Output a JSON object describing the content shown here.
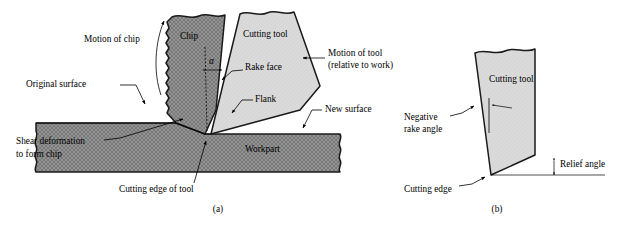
{
  "figure": {
    "subcaptions": [
      {
        "id": "a",
        "label": "(a)"
      },
      {
        "id": "b",
        "label": "(b)"
      }
    ]
  },
  "panel_a": {
    "region_labels": {
      "chip": "Chip",
      "cutting_tool": "Cutting tool",
      "workpart": "Workpart"
    },
    "callouts": {
      "motion_of_chip": "Motion of chip",
      "original_surface": "Original surface",
      "shear_deformation_line1": "Shear deformation",
      "shear_deformation_line2": "to form chip",
      "cutting_edge_of_tool": "Cutting edge of tool",
      "rake_face": "Rake face",
      "flank": "Flank",
      "motion_of_tool_line1": "Motion of tool",
      "motion_of_tool_line2": "(relative to work)",
      "new_surface": "New surface",
      "rake_angle_symbol": "α"
    }
  },
  "panel_b": {
    "region_labels": {
      "cutting_tool": "Cutting tool"
    },
    "callouts": {
      "negative_rake_line1": "Negative",
      "negative_rake_line2": "rake angle",
      "cutting_edge": "Cutting edge",
      "relief_angle": "Relief angle"
    }
  },
  "colors": {
    "background": "#ffffff",
    "chip_fill": "#8f8f8f",
    "workpart_fill": "#8f8f8f",
    "tool_fill": "#d9d9d9",
    "outline": "#1a1a1a",
    "text": "#000000"
  }
}
